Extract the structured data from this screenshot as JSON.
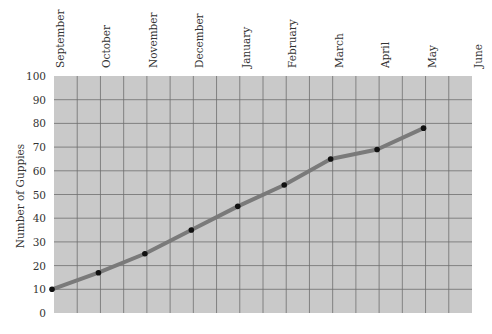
{
  "chart_data": {
    "type": "line",
    "title": "",
    "xlabel": "",
    "ylabel": "Number of Guppies",
    "categories": [
      "September",
      "October",
      "November",
      "December",
      "January",
      "February",
      "March",
      "April",
      "May",
      "June"
    ],
    "series": [
      {
        "name": "Number of Guppies",
        "values": [
          10,
          17,
          25,
          35,
          45,
          54,
          65,
          69,
          78,
          null
        ]
      }
    ],
    "y_ticks": [
      0,
      10,
      20,
      30,
      40,
      50,
      60,
      70,
      80,
      90,
      100
    ],
    "ylim": [
      0,
      100
    ],
    "grid": true,
    "legend": "none",
    "colors": {
      "plot_background": "#c9c9c9",
      "grid_line": "#6e6e6e",
      "series_line": "#7a7a7a",
      "marker": "#111111"
    }
  }
}
